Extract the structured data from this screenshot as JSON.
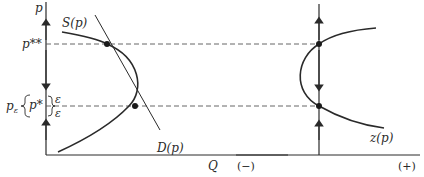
{
  "figure": {
    "left_panel": {
      "y_axis_label": "p",
      "x_axis_label": "Q",
      "supply_label": "S(p)",
      "demand_label": "D(p)",
      "price_high_label": "p**",
      "price_low_label": "p*",
      "band_label": "p",
      "band_subscript": "ε",
      "epsilon_upper": "ε",
      "epsilon_lower": "ε"
    },
    "right_panel": {
      "curve_label": "z(p)",
      "x_neg_label": "(−)",
      "x_pos_label": "(+)"
    },
    "colors": {
      "ink": "#2a2a2a",
      "dashed": "#555555",
      "background": "#ffffff"
    },
    "equilibria": [
      {
        "name": "p**",
        "y_px": 44
      },
      {
        "name": "p*",
        "y_px": 106
      }
    ]
  }
}
